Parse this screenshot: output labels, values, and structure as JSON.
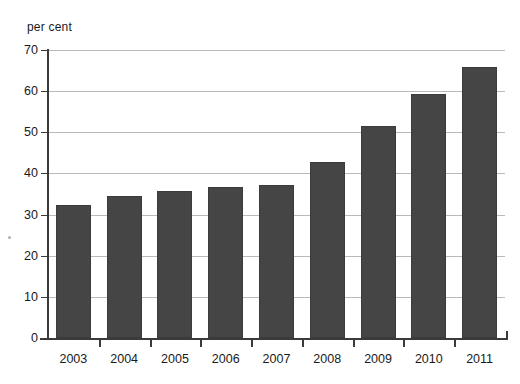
{
  "chart_data": {
    "type": "bar",
    "title": "",
    "subtitle": "",
    "xlabel": "",
    "ylabel": "per cent",
    "unit_caption": "per cent",
    "categories": [
      "2003",
      "2004",
      "2005",
      "2006",
      "2007",
      "2008",
      "2009",
      "2010",
      "2011"
    ],
    "values": [
      32.3,
      34.4,
      35.8,
      36.7,
      37.2,
      42.7,
      51.5,
      59.4,
      65.8
    ],
    "ylim": [
      0,
      70
    ],
    "ytick_labels": [
      "0",
      "10",
      "20",
      "30",
      "40",
      "50",
      "60",
      "70"
    ],
    "ytick_values": [
      0,
      10,
      20,
      30,
      40,
      50,
      60,
      70
    ],
    "grid": "horizontal",
    "legend": "none",
    "series": [
      {
        "name": "per cent",
        "color": "#454545",
        "values": [
          32.3,
          34.4,
          35.8,
          36.7,
          37.2,
          42.7,
          51.5,
          59.4,
          65.8
        ]
      }
    ],
    "colors": {
      "bar_fill": "#454545",
      "bar_edge": "#3b3b3b",
      "gridline": "#b9b9b9",
      "axis": "#3a3a3a",
      "text": "#1a1a1a",
      "background": "#ffffff"
    }
  }
}
